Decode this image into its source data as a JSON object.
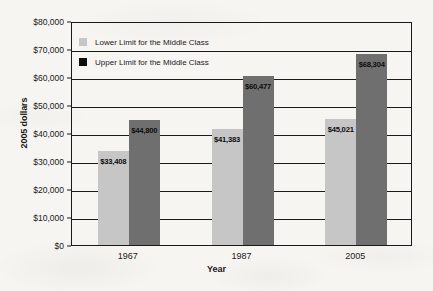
{
  "chart_data": {
    "type": "bar",
    "title": "",
    "xlabel": "Year",
    "ylabel": "2005 dollars",
    "categories": [
      "1967",
      "1987",
      "2005"
    ],
    "series": [
      {
        "name": "Lower Limit for the Middle Class",
        "color": "#c6c6c6",
        "values": [
          33408,
          41383,
          45021
        ],
        "labels": [
          "$33,408",
          "$41,383",
          "$45,021"
        ]
      },
      {
        "name": "Upper Limit for the Middle Class",
        "color": "#6f6f6f",
        "legend_color": "#0d0d0d",
        "values": [
          44800,
          60477,
          68304
        ],
        "labels": [
          "$44,800",
          "$60,477",
          "$68,304"
        ]
      }
    ],
    "ylim": [
      0,
      80000
    ],
    "yticks": [
      0,
      10000,
      20000,
      30000,
      40000,
      50000,
      60000,
      70000,
      80000
    ],
    "ytick_labels": [
      "$0",
      "$10,000",
      "$20,000",
      "$30,000",
      "$40,000",
      "$50,000",
      "$60,000",
      "$70,000",
      "$80,000"
    ],
    "grid": true,
    "legend_position": "top-left"
  },
  "legend": {
    "items": [
      {
        "label": "Lower Limit for the Middle Class"
      },
      {
        "label": "Upper Limit for the Middle Class"
      }
    ]
  }
}
